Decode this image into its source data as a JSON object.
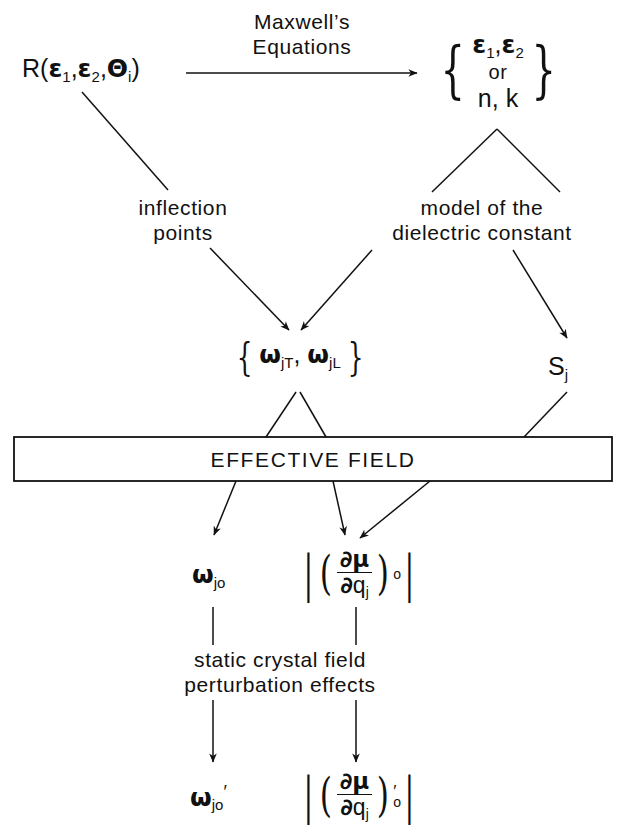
{
  "diagram": {
    "background": "#ffffff",
    "ink": "#111111"
  },
  "nodes": {
    "reflectivity": {
      "label": "R(ε₁,ε₂,θᵢ)",
      "R": "R",
      "open_paren": "(",
      "eps": "ε",
      "sub1": "1",
      "comma": ",",
      "sub2": "2",
      "theta": "Θ",
      "subi": "i",
      "close_paren": ")"
    },
    "maxwell_label": {
      "line1": "Maxwell’s",
      "line2": "Equations"
    },
    "eps_group": {
      "brace_open": "{",
      "brace_close": "}",
      "row1_eps": "ε",
      "row1_sub1": "1",
      "row1_comma": ",",
      "row1_sub2": "2",
      "row2": "or",
      "row3": "n, k"
    },
    "inflection": {
      "line1": "inflection",
      "line2": "points"
    },
    "model": {
      "line1": "model of the",
      "line2": "dielectric constant"
    },
    "omega_group": {
      "brace_open": "{",
      "brace_close": "}",
      "omega": "ω",
      "sub_jT": "jT",
      "comma": ",",
      "sub_jL": "jL"
    },
    "strength": {
      "S": "S",
      "sub": "j"
    },
    "effective_field": {
      "label": "EFFECTIVE  FIELD"
    },
    "omega_jo": {
      "omega": "ω",
      "sub": "jo"
    },
    "dipole_deriv": {
      "bar": "|",
      "paren_open": "(",
      "paren_close": ")",
      "num_partial": "∂",
      "num_mu": "μ",
      "den_partial": "∂",
      "den_q": "q",
      "den_sub": "j",
      "outer_sub": "o"
    },
    "perturbation": {
      "line1": "static crystal field",
      "line2": "perturbation effects"
    },
    "omega_jo_prime": {
      "omega": "ω",
      "sub": "jo",
      "prime": "′"
    },
    "dipole_deriv_prime": {
      "bar": "|",
      "paren_open": "(",
      "paren_close": ")",
      "num_partial": "∂",
      "num_mu": "μ",
      "den_partial": "∂",
      "den_q": "q",
      "den_sub": "j",
      "outer_sub": "o",
      "prime": "′"
    }
  },
  "edges": [
    {
      "name": "reflectivity-to-eps-group",
      "style": "arrow",
      "label": "Maxwell’s Equations"
    },
    {
      "name": "reflectivity-to-inflection",
      "style": "line"
    },
    {
      "name": "eps-group-to-model",
      "style": "line"
    },
    {
      "name": "eps-group-to-strength",
      "style": "line"
    },
    {
      "name": "inflection-to-omega-group",
      "style": "arrow"
    },
    {
      "name": "model-to-omega-group",
      "style": "arrow"
    },
    {
      "name": "model-to-strength",
      "style": "arrow"
    },
    {
      "name": "omega-group-to-effective-field",
      "style": "line"
    },
    {
      "name": "strength-to-effective-field",
      "style": "line"
    },
    {
      "name": "effective-field-to-omega-jo",
      "style": "arrow"
    },
    {
      "name": "effective-field-to-dipole-deriv",
      "style": "arrow"
    },
    {
      "name": "effective-field-right-to-dipole-deriv",
      "style": "arrow"
    },
    {
      "name": "omega-jo-to-omega-jo-prime",
      "style": "arrow"
    },
    {
      "name": "dipole-deriv-to-dipole-deriv-prime",
      "style": "arrow"
    }
  ]
}
